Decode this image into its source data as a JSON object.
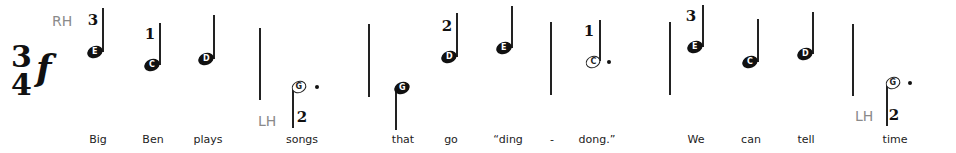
{
  "hands": {
    "rh": "RH",
    "lh": "LH"
  },
  "time_signature": {
    "top": "3",
    "bottom": "4"
  },
  "dynamic": "f",
  "notes": [
    {
      "letter": "E",
      "type": "quarter",
      "finger": "3",
      "lyric": "Big"
    },
    {
      "letter": "C",
      "type": "quarter",
      "finger": "1",
      "lyric": "Ben"
    },
    {
      "letter": "D",
      "type": "quarter",
      "finger": "",
      "lyric": "plays"
    },
    {
      "letter": "G",
      "type": "dotted-half",
      "finger": "2",
      "lyric": "songs",
      "hand": "LH"
    },
    {
      "letter": "G",
      "type": "quarter",
      "finger": "",
      "lyric": "that"
    },
    {
      "letter": "D",
      "type": "quarter",
      "finger": "2",
      "lyric": "go"
    },
    {
      "letter": "E",
      "type": "quarter",
      "finger": "",
      "lyric": "“ding"
    },
    {
      "letter": "C",
      "type": "dotted-half",
      "finger": "1",
      "lyric": "dong.”"
    },
    {
      "letter": "E",
      "type": "quarter",
      "finger": "3",
      "lyric": "We"
    },
    {
      "letter": "C",
      "type": "quarter",
      "finger": "",
      "lyric": "can"
    },
    {
      "letter": "D",
      "type": "quarter",
      "finger": "",
      "lyric": "tell"
    },
    {
      "letter": "G",
      "type": "dotted-half",
      "finger": "2",
      "lyric": "time",
      "hand": "LH"
    }
  ],
  "hyphen": "-"
}
